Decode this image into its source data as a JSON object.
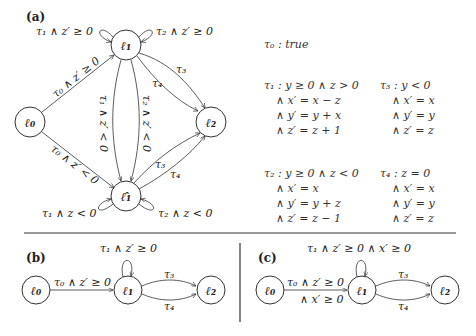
{
  "panel_a": {
    "label": "(a)",
    "nodes": {
      "l0": "ℓ₀",
      "l1": "ℓ₁",
      "l1hat": "ℓ̂₁",
      "l2": "ℓ₂"
    },
    "edges": {
      "loop_l1_left": "τ₁ ∧ z′ ≥ 0",
      "loop_l1_right": "τ₂ ∧ z′ ≥ 0",
      "l0_l1": "τ₀ ∧ z′ ≥ 0",
      "l0_l1hat": "τ₀ ∧ z′ < 0",
      "l1_l1hat_left": "τ₁ ∧ z′ < 0",
      "l1_l1hat_right": "τ₂ ∧ z′ < 0",
      "l1_l2_top": "τ₃",
      "l1_l2_bottom": "τ₄",
      "l1hat_l2_top": "τ₃",
      "l1hat_l2_bottom": "τ₄",
      "loop_l1hat_left": "τ₁ ∧ z < 0",
      "loop_l1hat_right": "τ₂ ∧ z < 0"
    },
    "transitions": {
      "tau0": "τ₀ : true",
      "tau1": [
        "τ₁ :  y ≥ 0 ∧ z > 0",
        "∧  x′ = x − z",
        "∧  y′ = y + x",
        "∧  z′ = z + 1"
      ],
      "tau3": [
        "τ₃ :  y < 0",
        "∧  x′ = x",
        "∧  y′ = y",
        "∧  z′ = z"
      ],
      "tau2": [
        "τ₂ :  y ≥ 0 ∧ z < 0",
        "∧  x′ = x",
        "∧  y′ = y + z",
        "∧  z′ = z − 1"
      ],
      "tau4": [
        "τ₄ :  z = 0",
        "∧  x′ = x",
        "∧  y′ = y",
        "∧  z′ = z"
      ]
    }
  },
  "panel_b": {
    "label": "(b)",
    "nodes": {
      "l0": "ℓ₀",
      "l1": "ℓ₁",
      "l2": "ℓ₂"
    },
    "edges": {
      "loop_l1": "τ₁ ∧ z′ ≥ 0",
      "l0_l1": "τ₀ ∧ z′ ≥ 0",
      "l1_l2_top": "τ₃",
      "l1_l2_bottom": "τ₄"
    }
  },
  "panel_c": {
    "label": "(c)",
    "nodes": {
      "l0": "ℓ₀",
      "l1": "ℓ₁",
      "l2": "ℓ₂"
    },
    "edges": {
      "loop_l1": "τ₁ ∧ z′ ≥ 0 ∧ x′ ≥ 0",
      "l0_l1_line1": "τ₀ ∧ z′ ≥ 0",
      "l0_l1_line2": "∧ x′ ≥ 0",
      "l1_l2_top": "τ₃",
      "l1_l2_bottom": "τ₄"
    }
  }
}
